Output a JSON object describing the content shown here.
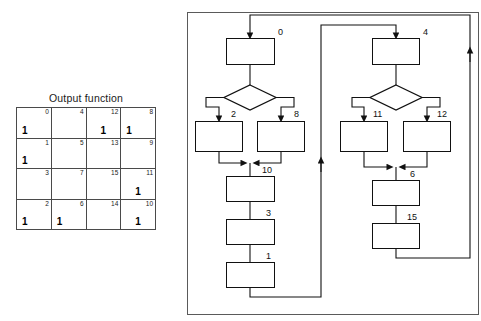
{
  "kmap": {
    "title": "Output function",
    "columns": 4,
    "rows": 4,
    "cells": [
      {
        "index": "0",
        "value": "1",
        "align": "left"
      },
      {
        "index": "4",
        "value": "",
        "align": "center"
      },
      {
        "index": "12",
        "value": "1",
        "align": "center"
      },
      {
        "index": "8",
        "value": "1",
        "align": "left"
      },
      {
        "index": "1",
        "value": "1",
        "align": "left"
      },
      {
        "index": "5",
        "value": "",
        "align": "center"
      },
      {
        "index": "13",
        "value": "",
        "align": "center"
      },
      {
        "index": "9",
        "value": "",
        "align": "center"
      },
      {
        "index": "3",
        "value": "",
        "align": "center"
      },
      {
        "index": "7",
        "value": "",
        "align": "center"
      },
      {
        "index": "15",
        "value": "",
        "align": "center"
      },
      {
        "index": "11",
        "value": "1",
        "align": "center"
      },
      {
        "index": "2",
        "value": "1",
        "align": "left"
      },
      {
        "index": "6",
        "value": "1",
        "align": "left"
      },
      {
        "index": "14",
        "value": "",
        "align": "center"
      },
      {
        "index": "10",
        "value": "1",
        "align": "center"
      }
    ]
  },
  "flowchart": {
    "node_labels": {
      "n0": "0",
      "n2": "2",
      "n8": "8",
      "n10": "10",
      "n3": "3",
      "n1": "1",
      "n4": "4",
      "n11": "11",
      "n12": "12",
      "n6": "6",
      "n15": "15"
    },
    "colors": {
      "stroke": "#111111",
      "frame": "#5a5a5a",
      "grid": "#4a4a4a",
      "background": "#ffffff"
    }
  }
}
